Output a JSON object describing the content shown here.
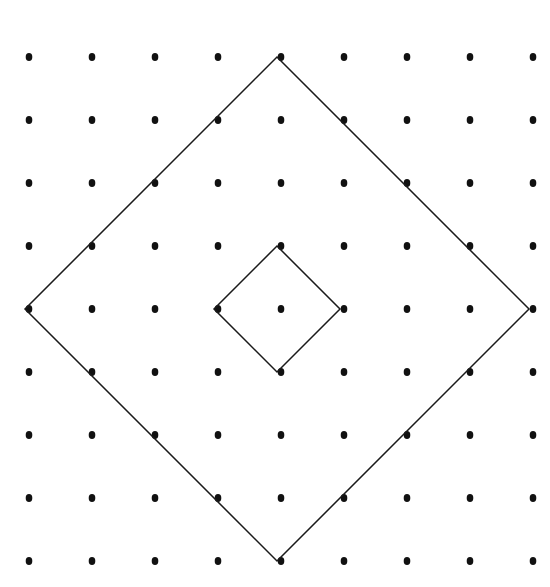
{
  "figure": {
    "panel_label": "(a)",
    "width": 550,
    "height": 587,
    "background_color": "#ffffff",
    "ink_color": "#000000",
    "label_color": "#1a1a1a"
  },
  "chart_data": {
    "type": "scatter",
    "title": "(a)",
    "subtitle": "",
    "xlabel": "",
    "ylabel": "",
    "grid": false,
    "legend": null,
    "lattice": {
      "rows": 9,
      "columns": 9,
      "origin_x": 29,
      "origin_y": 57,
      "spacing_x": 63,
      "spacing_y": 63,
      "dot_radius": 3.6,
      "dot_color": "#111111",
      "x": [
        29,
        92,
        155,
        218,
        281,
        344,
        407,
        470,
        533
      ],
      "y": [
        57,
        120,
        183,
        246,
        309,
        372,
        435,
        498,
        561
      ]
    },
    "annotations": [
      {
        "name": "large-diamond-cell",
        "shape": "square-rotated-45",
        "stroke_color": "#1a1a1a",
        "stroke_width": 1.5,
        "center": [
          277,
          309
        ],
        "half_diagonal": 252,
        "vertices": [
          [
            277,
            57
          ],
          [
            529,
            309
          ],
          [
            277,
            561
          ],
          [
            25,
            309
          ]
        ],
        "lattice_span_units": 4
      },
      {
        "name": "small-diamond-cell",
        "shape": "square-rotated-45",
        "stroke_color": "#1a1a1a",
        "stroke_width": 1.5,
        "center": [
          277,
          309
        ],
        "half_diagonal": 63,
        "vertices": [
          [
            277,
            246
          ],
          [
            340,
            309
          ],
          [
            277,
            372
          ],
          [
            214,
            309
          ]
        ],
        "lattice_span_units": 1
      }
    ]
  }
}
